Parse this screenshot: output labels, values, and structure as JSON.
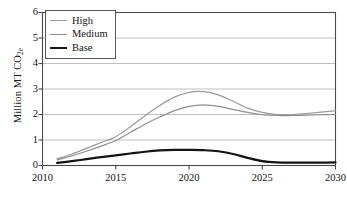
{
  "chart_data": {
    "type": "line",
    "title": "",
    "xlabel": "",
    "ylabel": "Million MT CO2e",
    "ylabel_main": "Million MT CO",
    "ylabel_sub": "2e",
    "xlim": [
      2010,
      2030
    ],
    "ylim": [
      0,
      6
    ],
    "grid": true,
    "legend_position": "top-left",
    "xticks": [
      2010,
      2015,
      2020,
      2025,
      2030
    ],
    "yticks": [
      0,
      1,
      2,
      3,
      4,
      5,
      6
    ],
    "x": [
      2011,
      2012,
      2013,
      2014,
      2015,
      2016,
      2017,
      2018,
      2019,
      2020,
      2021,
      2022,
      2023,
      2024,
      2025,
      2026,
      2027,
      2028,
      2029,
      2030
    ],
    "series": [
      {
        "name": "High",
        "color": "#9a9a9a",
        "width": 1.2,
        "values": [
          0.26,
          0.45,
          0.67,
          0.9,
          1.13,
          1.52,
          1.95,
          2.35,
          2.68,
          2.87,
          2.9,
          2.77,
          2.52,
          2.25,
          2.08,
          2.0,
          2.0,
          2.04,
          2.09,
          2.15
        ]
      },
      {
        "name": "Medium",
        "color": "#8f8f8f",
        "width": 1.2,
        "values": [
          0.22,
          0.38,
          0.56,
          0.76,
          0.98,
          1.3,
          1.62,
          1.9,
          2.15,
          2.32,
          2.38,
          2.32,
          2.2,
          2.08,
          1.99,
          1.96,
          1.96,
          1.97,
          1.99,
          2.0
        ]
      },
      {
        "name": "Base",
        "color": "#141414",
        "width": 2.2,
        "values": [
          0.1,
          0.17,
          0.25,
          0.33,
          0.4,
          0.47,
          0.54,
          0.59,
          0.61,
          0.61,
          0.6,
          0.56,
          0.45,
          0.3,
          0.17,
          0.12,
          0.11,
          0.11,
          0.11,
          0.12
        ]
      }
    ]
  },
  "legend": {
    "items": [
      {
        "label": "High"
      },
      {
        "label": "Medium"
      },
      {
        "label": "Base"
      }
    ]
  },
  "axes": {
    "y_title_main": "Million MT CO",
    "y_title_sub": "2e",
    "y_tick_labels": [
      "6",
      "5",
      "4",
      "3",
      "2",
      "1",
      "0"
    ],
    "x_tick_labels": [
      "2010",
      "2015",
      "2020",
      "2025",
      "2030"
    ]
  },
  "colors": {
    "grid": "#b8b8b8",
    "frame": "#4a4a4a",
    "text": "#141414",
    "background": "#ffffff"
  }
}
